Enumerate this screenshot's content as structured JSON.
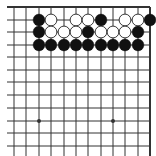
{
  "board": {
    "type": "go-board-fragment",
    "view": "top-right corner",
    "edges": {
      "top": true,
      "right": true,
      "left": false,
      "bottom": false
    },
    "colors": {
      "background": "#ffffff",
      "line": "#333333",
      "black_stone": "#111111",
      "white_stone": "#ffffff",
      "white_stone_border": "#222222"
    },
    "columns_x": [
      14,
      26,
      39,
      51,
      64,
      76,
      88,
      101,
      113,
      125,
      138,
      150
    ],
    "rows_y": [
      7,
      20,
      32,
      45,
      57,
      70,
      82,
      95,
      108,
      121,
      133,
      146
    ],
    "star_points": [
      {
        "col": 2,
        "row": 9
      },
      {
        "col": 8,
        "row": 9
      }
    ],
    "stones": [
      {
        "col": 2,
        "row": 1,
        "color": "black"
      },
      {
        "col": 3,
        "row": 1,
        "color": "white"
      },
      {
        "col": 5,
        "row": 1,
        "color": "white"
      },
      {
        "col": 6,
        "row": 1,
        "color": "white"
      },
      {
        "col": 7,
        "row": 1,
        "color": "black"
      },
      {
        "col": 9,
        "row": 1,
        "color": "white"
      },
      {
        "col": 10,
        "row": 1,
        "color": "white"
      },
      {
        "col": 11,
        "row": 1,
        "color": "black"
      },
      {
        "col": 2,
        "row": 2,
        "color": "black"
      },
      {
        "col": 3,
        "row": 2,
        "color": "white"
      },
      {
        "col": 4,
        "row": 2,
        "color": "white"
      },
      {
        "col": 5,
        "row": 2,
        "color": "white"
      },
      {
        "col": 6,
        "row": 2,
        "color": "black"
      },
      {
        "col": 7,
        "row": 2,
        "color": "white"
      },
      {
        "col": 8,
        "row": 2,
        "color": "white"
      },
      {
        "col": 9,
        "row": 2,
        "color": "white"
      },
      {
        "col": 10,
        "row": 2,
        "color": "black"
      },
      {
        "col": 2,
        "row": 3,
        "color": "black"
      },
      {
        "col": 3,
        "row": 3,
        "color": "black"
      },
      {
        "col": 4,
        "row": 3,
        "color": "black"
      },
      {
        "col": 5,
        "row": 3,
        "color": "black"
      },
      {
        "col": 6,
        "row": 3,
        "color": "black"
      },
      {
        "col": 7,
        "row": 3,
        "color": "black"
      },
      {
        "col": 8,
        "row": 3,
        "color": "black"
      },
      {
        "col": 9,
        "row": 3,
        "color": "black"
      },
      {
        "col": 10,
        "row": 3,
        "color": "black"
      }
    ]
  }
}
